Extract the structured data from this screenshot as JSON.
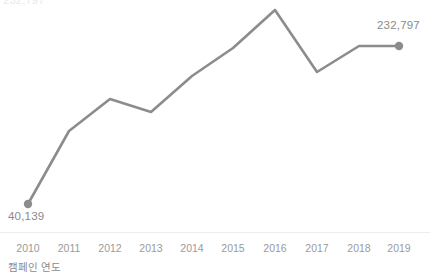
{
  "chart_data": {
    "type": "line",
    "title": "",
    "xlabel": "캠페인 연도",
    "ylabel": "",
    "categories": [
      "2010",
      "2011",
      "2012",
      "2013",
      "2014",
      "2015",
      "2016",
      "2017",
      "2018",
      "2019"
    ],
    "values": [
      40139,
      108000,
      131000,
      122000,
      148000,
      174000,
      200000,
      165000,
      232797,
      232797
    ],
    "series": [
      {
        "name": "캠페인 연도",
        "values": [
          40139,
          108000,
          131000,
          122000,
          148000,
          174000,
          200000,
          165000,
          232797,
          232797
        ]
      }
    ],
    "point_labels": {
      "first": "40,139",
      "last": "232,797"
    },
    "pixel_points": [
      {
        "x": 28,
        "y": 204
      },
      {
        "x": 69,
        "y": 131
      },
      {
        "x": 110,
        "y": 99
      },
      {
        "x": 151,
        "y": 112
      },
      {
        "x": 192,
        "y": 76
      },
      {
        "x": 233,
        "y": 48
      },
      {
        "x": 275,
        "y": 10
      },
      {
        "x": 317,
        "y": 72
      },
      {
        "x": 359,
        "y": 46
      },
      {
        "x": 399,
        "y": 46
      }
    ],
    "tick_positions": [
      28,
      69,
      110,
      151,
      192,
      233,
      275,
      317,
      359,
      399
    ],
    "markers": [
      "2010",
      "2019"
    ],
    "grid": false,
    "legend": false,
    "line_color": "#8c8c8c",
    "marker_color": "#8c8c8c",
    "label_color": "#8a8a8a",
    "tick_color": "#9a9a9a",
    "axis_color": "#ededed",
    "background": "#ffffff"
  },
  "labels": {
    "first_value": "40,139",
    "last_value": "232,797",
    "x_axis_title": "캠페인 연도",
    "clipped_title": "232,797"
  }
}
